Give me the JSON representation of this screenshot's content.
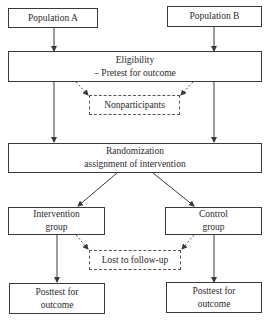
{
  "diagram": {
    "type": "flowchart",
    "nodes": {
      "population_a": {
        "lines": [
          "Population A"
        ]
      },
      "population_b": {
        "lines": [
          "Population B"
        ]
      },
      "eligibility": {
        "lines": [
          "Eligibility",
          "– Pretest for outcome"
        ]
      },
      "nonparticipants": {
        "lines": [
          "Nonparticipants"
        ],
        "style": "dashed"
      },
      "randomization": {
        "lines": [
          "Randomization",
          "assignment of intervention"
        ]
      },
      "intervention": {
        "lines": [
          "Intervention",
          "group"
        ]
      },
      "control": {
        "lines": [
          "Control",
          "group"
        ]
      },
      "lost": {
        "lines": [
          "Lost to follow-up"
        ],
        "style": "dashed"
      },
      "posttest_left": {
        "lines": [
          "Posttest for",
          "outcome"
        ]
      },
      "posttest_right": {
        "lines": [
          "Posttest for",
          "outcome"
        ]
      }
    },
    "edges": [
      {
        "from": "population_a",
        "to": "eligibility",
        "style": "solid"
      },
      {
        "from": "population_b",
        "to": "eligibility",
        "style": "solid"
      },
      {
        "from": "eligibility",
        "to": "nonparticipants",
        "style": "dashed"
      },
      {
        "from": "eligibility",
        "to": "randomization",
        "style": "solid"
      },
      {
        "from": "randomization",
        "to": "intervention",
        "style": "solid"
      },
      {
        "from": "randomization",
        "to": "control",
        "style": "solid"
      },
      {
        "from": "intervention",
        "to": "lost",
        "style": "dashed"
      },
      {
        "from": "control",
        "to": "lost",
        "style": "dashed"
      },
      {
        "from": "intervention",
        "to": "posttest_left",
        "style": "solid"
      },
      {
        "from": "control",
        "to": "posttest_right",
        "style": "solid"
      }
    ],
    "colors": {
      "stroke": "#3a3a3a",
      "text": "#2a2a2a",
      "background": "#ffffff"
    }
  }
}
